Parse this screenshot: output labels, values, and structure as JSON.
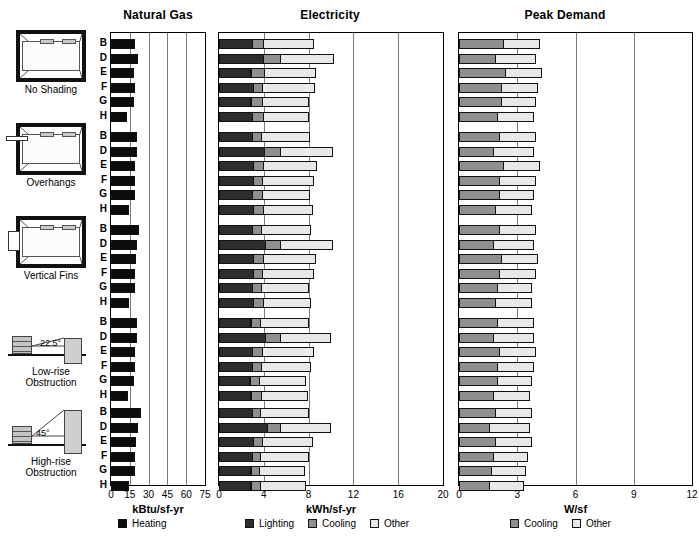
{
  "panels": [
    {
      "id": "natural-gas",
      "title": "Natural Gas",
      "unit": "kBtu/sf-yr",
      "ticks": [
        0,
        15,
        30,
        45,
        60,
        75
      ],
      "xmin": 0,
      "xmax": 75,
      "legend": [
        {
          "label": "Heating",
          "key": "heating",
          "color": "#0c0c0c"
        }
      ]
    },
    {
      "id": "electricity",
      "title": "Electricity",
      "unit": "kWh/sf-yr",
      "ticks": [
        0,
        4,
        8,
        12,
        16,
        20
      ],
      "xmin": 0,
      "xmax": 20,
      "legend": [
        {
          "label": "Lighting",
          "key": "lighting",
          "color": "#2d2d2d"
        },
        {
          "label": "Cooling",
          "key": "cooling",
          "color": "#8f8f8f"
        },
        {
          "label": "Other",
          "key": "other",
          "color": "#e8e8e8"
        }
      ]
    },
    {
      "id": "peak-demand",
      "title": "Peak Demand",
      "unit": "W/sf",
      "ticks": [
        0,
        3,
        6,
        9,
        12
      ],
      "xmin": 0,
      "xmax": 12,
      "legend": [
        {
          "label": "Cooling",
          "key": "cooling",
          "color": "#8f8f8f"
        },
        {
          "label": "Other",
          "key": "other",
          "color": "#e8e8e8"
        }
      ]
    }
  ],
  "case_letters": [
    "B",
    "D",
    "E",
    "F",
    "G",
    "H"
  ],
  "scenarios": [
    {
      "id": "no-shading",
      "caption": "No Shading",
      "diagram": "plan-room",
      "angle": ""
    },
    {
      "id": "overhangs",
      "caption": "Overhangs",
      "diagram": "plan-overhang",
      "angle": ""
    },
    {
      "id": "vertical-fins",
      "caption": "Vertical Fins",
      "diagram": "plan-fins",
      "angle": ""
    },
    {
      "id": "low-rise-obstruction",
      "caption": "Low-rise\nObstruction",
      "diagram": "obstruction-low",
      "angle": "22.5°"
    },
    {
      "id": "high-rise-obstruction",
      "caption": "High-rise\nObstruction",
      "diagram": "obstruction-high",
      "angle": "45°"
    }
  ],
  "chart_data": {
    "type": "bar",
    "orientation": "horizontal",
    "layout": "3 stacked-bar panels x 5 scenario groups x 6 cases",
    "title": "",
    "groups": [
      "No Shading",
      "Overhangs",
      "Vertical Fins",
      "Low-rise Obstruction",
      "High-rise Obstruction"
    ],
    "categories": [
      "B",
      "D",
      "E",
      "F",
      "G",
      "H"
    ],
    "panels": [
      {
        "name": "Natural Gas",
        "type": "bar",
        "xlabel": "kBtu/sf-yr",
        "xlim": [
          0,
          75
        ],
        "xticks": [
          0,
          15,
          30,
          45,
          60,
          75
        ],
        "grid": true,
        "series": [
          {
            "name": "Heating",
            "color": "#0c0c0c"
          }
        ],
        "values": {
          "No Shading": {
            "Heating": [
              19.5,
              21.5,
              18.0,
              19.0,
              18.5,
              13.0
            ]
          },
          "Overhangs": {
            "Heating": [
              21.0,
              21.0,
              19.0,
              19.0,
              19.5,
              14.5
            ]
          },
          "Vertical Fins": {
            "Heating": [
              22.0,
              21.0,
              20.0,
              19.0,
              19.5,
              14.0
            ]
          },
          "Low-rise Obstruction": {
            "Heating": [
              20.5,
              21.0,
              19.0,
              19.0,
              18.5,
              13.5
            ]
          },
          "High-rise Obstruction": {
            "Heating": [
              24.0,
              21.5,
              20.0,
              19.0,
              19.5,
              14.0
            ]
          }
        }
      },
      {
        "name": "Electricity",
        "type": "stacked-bar",
        "xlabel": "kWh/sf-yr",
        "xlim": [
          0,
          20
        ],
        "xticks": [
          0,
          4,
          8,
          12,
          16,
          20
        ],
        "grid": true,
        "series": [
          {
            "name": "Lighting",
            "color": "#2d2d2d"
          },
          {
            "name": "Cooling",
            "color": "#8f8f8f"
          },
          {
            "name": "Other",
            "color": "#e8e8e8"
          }
        ],
        "values": {
          "No Shading": {
            "Lighting": [
              3.0,
              4.0,
              2.9,
              3.1,
              2.9,
              3.0
            ],
            "Cooling": [
              1.1,
              1.6,
              1.3,
              0.9,
              1.1,
              1.1
            ],
            "Other": [
              4.5,
              4.8,
              4.6,
              4.7,
              4.2,
              4.1
            ]
          },
          "Overhangs": {
            "Lighting": [
              3.0,
              4.1,
              3.1,
              3.1,
              3.0,
              3.1
            ],
            "Cooling": [
              0.9,
              1.5,
              1.0,
              0.9,
              1.0,
              1.0
            ],
            "Other": [
              4.4,
              4.7,
              4.8,
              4.6,
              4.3,
              4.4
            ]
          },
          "Vertical Fins": {
            "Lighting": [
              3.0,
              4.2,
              3.1,
              3.1,
              3.0,
              3.1
            ],
            "Cooling": [
              0.9,
              1.4,
              1.0,
              0.9,
              0.9,
              1.0
            ],
            "Other": [
              4.5,
              4.7,
              4.7,
              4.6,
              4.3,
              4.3
            ]
          },
          "Low-rise Obstruction": {
            "Lighting": [
              2.9,
              4.2,
              3.0,
              3.0,
              2.8,
              2.9
            ],
            "Cooling": [
              0.9,
              1.4,
              1.0,
              0.9,
              0.9,
              1.0
            ],
            "Other": [
              4.4,
              4.5,
              4.6,
              4.5,
              4.2,
              4.2
            ]
          },
          "High-rise Obstruction": {
            "Lighting": [
              3.0,
              4.4,
              3.1,
              3.0,
              2.9,
              2.9
            ],
            "Cooling": [
              0.8,
              1.2,
              0.9,
              0.8,
              0.8,
              0.9
            ],
            "Other": [
              4.4,
              4.5,
              4.5,
              4.4,
              4.1,
              4.1
            ]
          }
        }
      },
      {
        "name": "Peak Demand",
        "type": "stacked-bar",
        "xlabel": "W/sf",
        "xlim": [
          0,
          12
        ],
        "xticks": [
          0,
          3,
          6,
          9,
          12
        ],
        "grid": true,
        "series": [
          {
            "name": "Cooling",
            "color": "#8f8f8f"
          },
          {
            "name": "Other",
            "color": "#e8e8e8"
          }
        ],
        "values": {
          "No Shading": {
            "Cooling": [
              2.3,
              1.9,
              2.4,
              2.2,
              2.2,
              2.0
            ],
            "Other": [
              1.9,
              2.1,
              1.9,
              1.9,
              1.8,
              1.9
            ]
          },
          "Overhangs": {
            "Cooling": [
              2.1,
              1.8,
              2.3,
              2.1,
              2.1,
              1.9
            ],
            "Other": [
              1.9,
              2.1,
              1.9,
              1.9,
              1.8,
              1.9
            ]
          },
          "Vertical Fins": {
            "Cooling": [
              2.1,
              1.8,
              2.2,
              2.1,
              2.0,
              1.9
            ],
            "Other": [
              1.9,
              2.1,
              1.9,
              1.9,
              1.8,
              1.9
            ]
          },
          "Low-rise Obstruction": {
            "Cooling": [
              2.0,
              1.8,
              2.1,
              2.0,
              2.0,
              1.8
            ],
            "Other": [
              1.9,
              2.1,
              1.9,
              1.9,
              1.8,
              1.9
            ]
          },
          "High-rise Obstruction": {
            "Cooling": [
              1.9,
              1.6,
              1.9,
              1.8,
              1.7,
              1.6
            ],
            "Other": [
              1.9,
              2.1,
              1.9,
              1.8,
              1.8,
              1.8
            ]
          }
        }
      }
    ]
  }
}
